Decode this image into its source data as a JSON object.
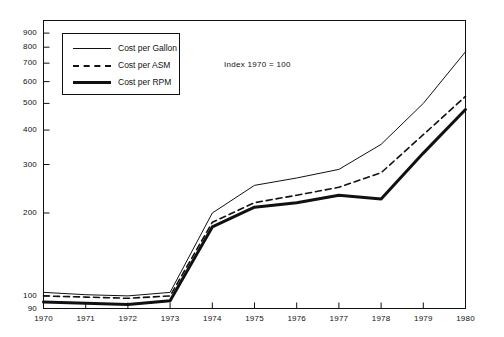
{
  "chart_data": {
    "type": "line",
    "title": "",
    "annotation": "Index 1970 = 100",
    "xlabel": "",
    "ylabel": "",
    "yscale": "log",
    "ylim": [
      90,
      1000
    ],
    "grid": false,
    "legend_position": "upper-left",
    "x": [
      1970,
      1971,
      1972,
      1973,
      1974,
      1975,
      1976,
      1977,
      1978,
      1979,
      1980
    ],
    "xtick_labels": [
      "1970",
      "1971",
      "1972",
      "1973",
      "1974",
      "1975",
      "1976",
      "1977",
      "1978",
      "1979",
      "1980"
    ],
    "ytick_labels": [
      "90",
      "100",
      "200",
      "300",
      "400",
      "500",
      "600",
      "700",
      "800",
      "900"
    ],
    "ytick_values": [
      90,
      100,
      200,
      300,
      400,
      500,
      600,
      700,
      800,
      900
    ],
    "series": [
      {
        "name": "Cost per Gallon",
        "style": "solid",
        "values": [
          103,
          101,
          100,
          103,
          200,
          252,
          268,
          288,
          355,
          500,
          770
        ]
      },
      {
        "name": "Cost per ASM",
        "style": "dashed",
        "values": [
          100,
          99,
          98,
          100,
          185,
          218,
          232,
          248,
          280,
          385,
          530
        ]
      },
      {
        "name": "Cost per RPM",
        "style": "thick-solid",
        "values": [
          95,
          94,
          93,
          96,
          178,
          210,
          218,
          232,
          225,
          330,
          475
        ]
      }
    ]
  },
  "legend": {
    "items": [
      {
        "label": "Cost per Gallon"
      },
      {
        "label": "Cost per ASM"
      },
      {
        "label": "Cost per RPM"
      }
    ]
  }
}
